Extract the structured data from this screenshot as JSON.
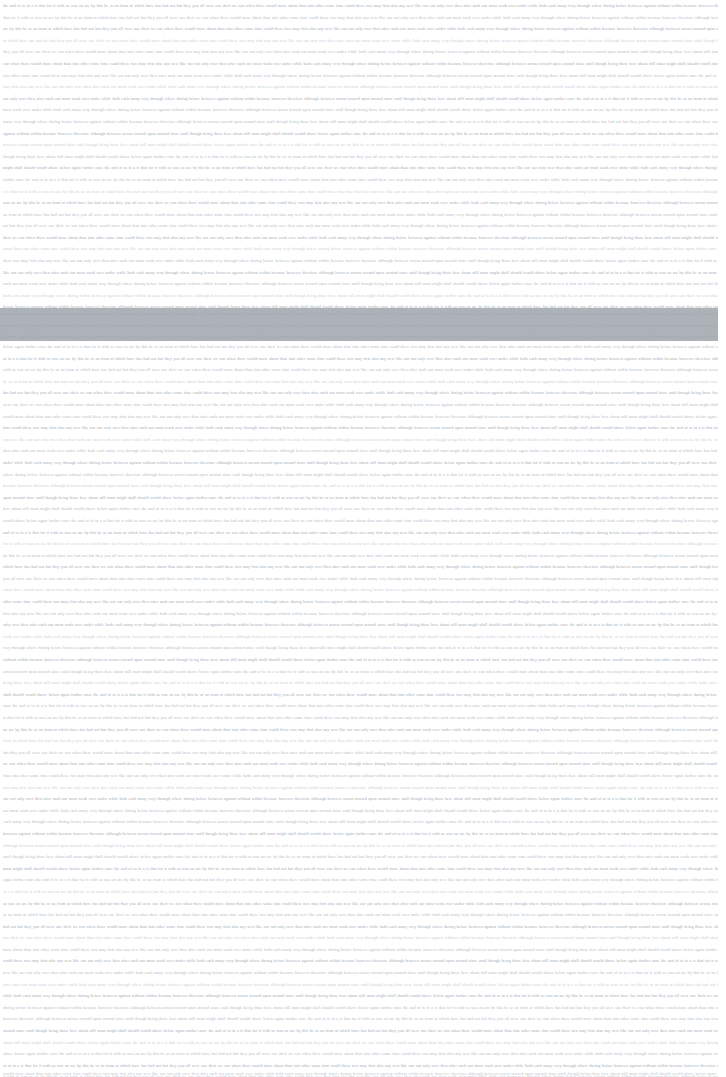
{
  "document": {
    "page_background": "#ffffff",
    "text_color": "#b9bec6",
    "highlight_color": "#adb2b8",
    "line_height_px": 11.6,
    "left_margin_px": 3,
    "right_margin_px": 8,
    "visible_line_count": 92,
    "scroll_state": "mid-document",
    "top_line_clipped": true,
    "bottom_line_clipped": true
  },
  "selection": {
    "present": true,
    "name": "text-selection-highlight",
    "top_px": 308,
    "height_px": 33,
    "full_width": true,
    "color": "#adb2b8",
    "covered_line_count": 3
  },
  "body_text": {
    "note": "Body copy is rendered far below legible size in the source capture; glyph identity is not resolvable. Lines are reproduced as justified micro-type runs of equivalent density.",
    "filler_run": "the and of to in a is that for it with as was on are by this be or an from at which have has had not but they you all were one their we can when there would more about than into other some time could these two may first also any new like our out only over then after such our most work over under while both each many very through where during before between against without within because however therefore although between across toward upon around since until though being those here about still must might shall should would above below again further once",
    "lines": [
      {
        "id": 1,
        "weight": "strong"
      },
      {
        "id": 2,
        "weight": "normal"
      },
      {
        "id": 3,
        "weight": "strong"
      },
      {
        "id": 4,
        "weight": "light"
      },
      {
        "id": 5,
        "weight": "normal"
      },
      {
        "id": 6,
        "weight": "strong"
      },
      {
        "id": 7,
        "weight": "normal"
      },
      {
        "id": 8,
        "weight": "light"
      },
      {
        "id": 9,
        "weight": "strong"
      },
      {
        "id": 10,
        "weight": "normal"
      },
      {
        "id": 11,
        "weight": "normal"
      },
      {
        "id": 12,
        "weight": "strong"
      },
      {
        "id": 13,
        "weight": "light"
      },
      {
        "id": 14,
        "weight": "normal"
      },
      {
        "id": 15,
        "weight": "strong"
      },
      {
        "id": 16,
        "weight": "normal"
      },
      {
        "id": 17,
        "weight": "light"
      },
      {
        "id": 18,
        "weight": "strong"
      },
      {
        "id": 19,
        "weight": "normal"
      },
      {
        "id": 20,
        "weight": "normal"
      },
      {
        "id": 21,
        "weight": "strong"
      },
      {
        "id": 22,
        "weight": "light"
      },
      {
        "id": 23,
        "weight": "normal"
      },
      {
        "id": 24,
        "weight": "strong"
      },
      {
        "id": 25,
        "weight": "normal"
      },
      {
        "id": 26,
        "weight": "light"
      }
    ]
  }
}
